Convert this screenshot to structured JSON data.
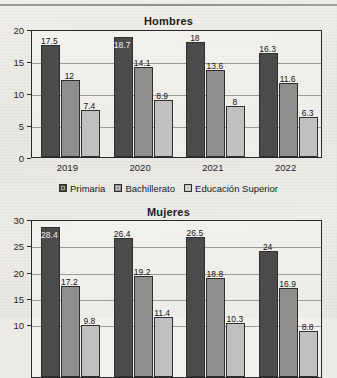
{
  "page": {
    "has_top_rule": true,
    "palette": {
      "primaria": "#4b4b4b",
      "bachillerato": "#8e8e8e",
      "educacion_superior": "#c0c0c0",
      "axis": "#2b2b2b",
      "grid": "#8d8d8d",
      "paper": "#ecebe7",
      "text": "#1c1c1c"
    }
  },
  "legend": {
    "items": [
      {
        "label": "Primaria",
        "swatch": "#4b4b4b"
      },
      {
        "label": "Bachillerato",
        "swatch": "#8e8e8e"
      },
      {
        "label": "Educación Superior",
        "swatch": "#c0c0c0"
      }
    ]
  },
  "chart_data": [
    {
      "type": "bar",
      "title": "Hombres",
      "xlabel": "",
      "ylabel": "",
      "categories": [
        "2019",
        "2020",
        "2021",
        "2022"
      ],
      "yticks": [
        0,
        5,
        10,
        15,
        20
      ],
      "ylim": [
        0,
        20
      ],
      "grid": true,
      "legend_position": "bottom",
      "series": [
        {
          "name": "Primaria",
          "values": [
            17.5,
            18.7,
            18,
            16.3
          ],
          "labels": [
            "17.5",
            "18.7",
            "18",
            "16.3"
          ]
        },
        {
          "name": "Bachillerato",
          "values": [
            12,
            14.1,
            13.6,
            11.6
          ],
          "labels": [
            "12",
            "14.1",
            "13.6",
            "11.6"
          ]
        },
        {
          "name": "Educación Superior",
          "values": [
            7.4,
            8.9,
            8,
            6.3
          ],
          "labels": [
            "7.4",
            "8.9",
            "8",
            "6.3"
          ]
        }
      ]
    },
    {
      "type": "bar",
      "title": "Mujeres",
      "xlabel": "",
      "ylabel": "",
      "categories": [
        "2019",
        "2020",
        "2021",
        "2022"
      ],
      "yticks": [
        10,
        15,
        20,
        25,
        30
      ],
      "ylim": [
        0,
        30
      ],
      "grid": true,
      "legend_position": "bottom",
      "cropped": true,
      "series": [
        {
          "name": "Primaria",
          "values": [
            28.4,
            26.4,
            26.5,
            24
          ],
          "labels": [
            "28.4",
            "26.4",
            "26.5",
            "24"
          ]
        },
        {
          "name": "Bachillerato",
          "values": [
            17.2,
            19.2,
            18.8,
            16.9
          ],
          "labels": [
            "17.2",
            "19.2",
            "18.8",
            "16.9"
          ]
        },
        {
          "name": "Educación Superior",
          "values": [
            9.8,
            11.4,
            10.3,
            8.8
          ],
          "labels": [
            "9.8",
            "11.4",
            "10.3",
            "8.8"
          ]
        }
      ]
    }
  ]
}
